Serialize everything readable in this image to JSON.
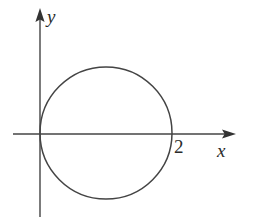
{
  "figure": {
    "background_color": "#ffffff",
    "stroke_color": "#444444",
    "width": 255,
    "height": 217
  },
  "labels": {
    "y_axis": "y",
    "x_axis": "x",
    "x_intercept": "2"
  },
  "chart_data": {
    "type": "scatter",
    "title": "",
    "subtitle": "",
    "xlabel": "x",
    "ylabel": "y",
    "grid": false,
    "legend": null,
    "axes": {
      "origin_px": [
        40,
        134
      ],
      "x_axis_px": {
        "start": 13,
        "end": 235,
        "y": 134,
        "arrow": "right"
      },
      "y_axis_px": {
        "top": 8,
        "bottom": 217,
        "x": 40,
        "arrow": "up"
      },
      "xlim": [
        -0.8,
        5.9
      ],
      "ylim": [
        -2.5,
        3.8
      ],
      "units_per_px": 0.0303
    },
    "tick_labels": {
      "x": [
        "2"
      ],
      "y": []
    },
    "annotations": [
      {
        "text": "2",
        "x": 2,
        "y": 0,
        "note": "x-intercept of circle, label placed below-right of crossing point"
      },
      {
        "text": "y",
        "x": 0,
        "y": 3.8,
        "note": "y-axis name at top of vertical axis"
      },
      {
        "text": "x",
        "x": 5.9,
        "y": -0.35,
        "note": "x-axis name at right of horizontal axis"
      }
    ],
    "series": [
      {
        "name": "circle",
        "type": "circle",
        "equation": "(x - 1)^2 + y^2 = 1",
        "center": [
          1,
          0
        ],
        "radius": 1,
        "center_px": [
          106,
          133
        ],
        "radius_px": 66,
        "tangent_to": "y-axis at origin (0, 0)",
        "x_intercepts": [
          0,
          2
        ],
        "y_intercepts": [
          0
        ],
        "stroke": "#444444",
        "stroke_width_px": 1.5,
        "fill": "none"
      }
    ]
  }
}
